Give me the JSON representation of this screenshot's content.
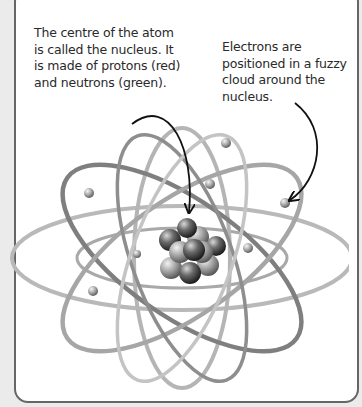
{
  "figure": {
    "labels": {
      "nucleus": "The centre of the atom is called the nucleus. It is made of protons (red) and neutrons (green).",
      "electrons": "Electrons are positioned in a fuzzy cloud around the nucleus."
    },
    "parts": [
      "nucleus",
      "protons",
      "neutrons",
      "electrons",
      "orbits"
    ],
    "colors": {
      "panel_background": "#ffffff",
      "page_background": "#ebebeb",
      "panel_border": "#666666",
      "text": "#2a2a2a"
    }
  }
}
